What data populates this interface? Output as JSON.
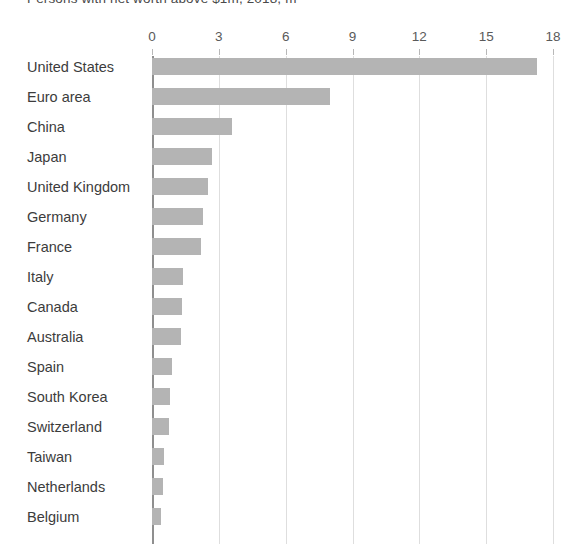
{
  "chart_data": {
    "type": "bar",
    "orientation": "horizontal",
    "title": "Persons with net worth above $1m, 2018, m",
    "xlabel": "",
    "ylabel": "",
    "xlim": [
      0,
      18
    ],
    "xticks": [
      0,
      3,
      6,
      9,
      12,
      15,
      18
    ],
    "xtick_labels": [
      "0",
      "3",
      "6",
      "9",
      "12",
      "15",
      "18"
    ],
    "grid": true,
    "legend": "none",
    "bar_color": "#b4b4b4",
    "gridline_color": "#dedede",
    "axis_color": "#8f8f8f",
    "categories": [
      "United States",
      "Euro area",
      "China",
      "Japan",
      "United Kingdom",
      "Germany",
      "France",
      "Italy",
      "Canada",
      "Australia",
      "Spain",
      "South Korea",
      "Switzerland",
      "Taiwan",
      "Netherlands",
      "Belgium"
    ],
    "values": [
      17.3,
      8.0,
      3.6,
      2.7,
      2.5,
      2.3,
      2.2,
      1.4,
      1.35,
      1.3,
      0.9,
      0.8,
      0.75,
      0.55,
      0.5,
      0.4
    ]
  }
}
